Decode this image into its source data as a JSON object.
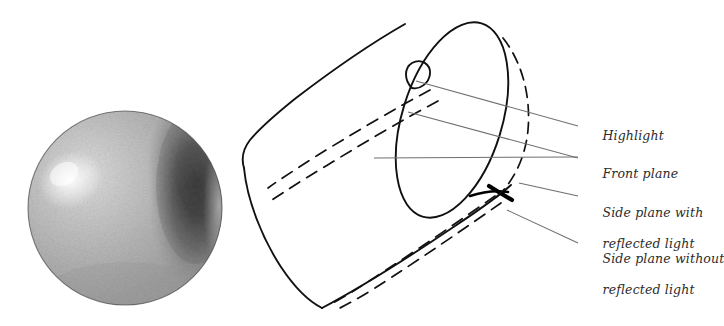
{
  "figure": {
    "background_color": "#ffffff",
    "ink_color": "#111111",
    "leader_color": "#6f6f6f",
    "label_color": "#2b2b2b"
  },
  "sphere": {
    "name": "shaded-sphere",
    "center_x": 125,
    "center_y": 208,
    "radius": 97,
    "highlight": {
      "x": 70,
      "y": 180,
      "radius": 34
    },
    "core_shadow": {
      "x": 196,
      "y": 178,
      "radius": 62
    },
    "reflected_light_edge": true,
    "texture": "graphite-tooth",
    "base_tone": "#b9b9b9",
    "highlight_tone": "#f0f0f0",
    "shadow_tone": "#2d2d2d"
  },
  "cylinder": {
    "name": "line-drawn-cylinder",
    "axis_angle_deg": 31,
    "top_ellipse": {
      "center_x": 452,
      "center_y": 120,
      "radius_x": 50,
      "radius_y": 101,
      "rotation_deg": 17
    },
    "highlight_loop": {
      "x": 418,
      "y": 75,
      "rx": 11,
      "ry": 14,
      "rotation_deg": 35
    },
    "dashed_guides": 4,
    "dark_accent_edge": true
  },
  "labels": [
    {
      "id": "highlight",
      "name": "label-highlight",
      "lines": [
        "Highlight"
      ],
      "text_x": 586,
      "text_y": 119,
      "leader": {
        "x1": 416,
        "y1": 81,
        "x2": 578,
        "y2": 126
      }
    },
    {
      "id": "front-plane",
      "name": "label-front-plane",
      "lines": [
        "Front plane"
      ],
      "text_x": 586,
      "text_y": 150,
      "leader": {
        "x1": 374,
        "y1": 158,
        "x2": 578,
        "y2": 157
      }
    },
    {
      "id": "side-plane-with-reflected-light",
      "name": "label-side-plane-with-reflected-light",
      "lines": [
        "Side plane with",
        "reflected light"
      ],
      "text_x": 586,
      "text_y": 189,
      "leader": {
        "x1": 519,
        "y1": 183,
        "x2": 578,
        "y2": 196
      }
    },
    {
      "id": "side-plane-without-reflected-light",
      "name": "label-side-plane-without-reflected-light",
      "lines": [
        "Side plane without",
        "reflected light"
      ],
      "text_x": 586,
      "text_y": 235,
      "leader": {
        "x1": 507,
        "y1": 210,
        "x2": 578,
        "y2": 243
      }
    }
  ]
}
